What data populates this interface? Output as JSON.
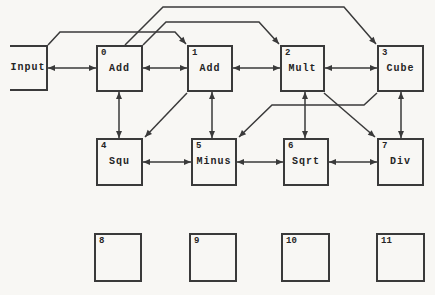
{
  "diagram": {
    "background_color": "#f8f7f4",
    "line_color": "#3a3a3a",
    "text_color": "#252525",
    "nodes": [
      {
        "id": "input",
        "number": "",
        "label": "Input",
        "x": 10,
        "y": 45,
        "w": 38,
        "h": 46,
        "open_left": true
      },
      {
        "id": "0",
        "number": "0",
        "label": "Add",
        "x": 96,
        "y": 45,
        "w": 47,
        "h": 47
      },
      {
        "id": "1",
        "number": "1",
        "label": "Add",
        "x": 187,
        "y": 45,
        "w": 46,
        "h": 47
      },
      {
        "id": "2",
        "number": "2",
        "label": "Mult",
        "x": 280,
        "y": 45,
        "w": 45,
        "h": 47
      },
      {
        "id": "3",
        "number": "3",
        "label": "Cube",
        "x": 377,
        "y": 45,
        "w": 47,
        "h": 47
      },
      {
        "id": "4",
        "number": "4",
        "label": "Squ",
        "x": 96,
        "y": 138,
        "w": 47,
        "h": 48
      },
      {
        "id": "5",
        "number": "5",
        "label": "Minus",
        "x": 191,
        "y": 138,
        "w": 46,
        "h": 48
      },
      {
        "id": "6",
        "number": "6",
        "label": "Sqrt",
        "x": 283,
        "y": 138,
        "w": 46,
        "h": 48
      },
      {
        "id": "7",
        "number": "7",
        "label": "Div",
        "x": 377,
        "y": 138,
        "w": 47,
        "h": 48
      },
      {
        "id": "8",
        "number": "8",
        "label": "",
        "x": 94,
        "y": 233,
        "w": 48,
        "h": 49
      },
      {
        "id": "9",
        "number": "9",
        "label": "",
        "x": 189,
        "y": 233,
        "w": 48,
        "h": 49
      },
      {
        "id": "10",
        "number": "10",
        "label": "",
        "x": 281,
        "y": 233,
        "w": 49,
        "h": 49
      },
      {
        "id": "11",
        "number": "11",
        "label": "",
        "x": 376,
        "y": 233,
        "w": 49,
        "h": 49
      }
    ],
    "edges": [
      {
        "name": "input-add0",
        "from": "input",
        "to": "0",
        "points": [
          [
            48,
            68
          ],
          [
            96,
            68
          ]
        ],
        "arrow_start": true,
        "arrow_end": true
      },
      {
        "name": "add0-add1",
        "from": "0",
        "to": "1",
        "points": [
          [
            143,
            68
          ],
          [
            187,
            68
          ]
        ],
        "arrow_start": true,
        "arrow_end": true
      },
      {
        "name": "add1-mult2",
        "from": "1",
        "to": "2",
        "points": [
          [
            233,
            68
          ],
          [
            280,
            68
          ]
        ],
        "arrow_start": true,
        "arrow_end": true
      },
      {
        "name": "mult2-cube3",
        "from": "2",
        "to": "3",
        "points": [
          [
            325,
            68
          ],
          [
            377,
            68
          ]
        ],
        "arrow_start": true,
        "arrow_end": true
      },
      {
        "name": "squ4-minus5",
        "from": "4",
        "to": "5",
        "points": [
          [
            143,
            162
          ],
          [
            191,
            162
          ]
        ],
        "arrow_start": true,
        "arrow_end": true
      },
      {
        "name": "minus5-sqrt6",
        "from": "5",
        "to": "6",
        "points": [
          [
            237,
            162
          ],
          [
            283,
            162
          ]
        ],
        "arrow_start": true,
        "arrow_end": true
      },
      {
        "name": "sqrt6-div7",
        "from": "6",
        "to": "7",
        "points": [
          [
            329,
            162
          ],
          [
            377,
            162
          ]
        ],
        "arrow_start": true,
        "arrow_end": true
      },
      {
        "name": "add0-squ4",
        "from": "0",
        "to": "4",
        "points": [
          [
            119,
            92
          ],
          [
            119,
            138
          ]
        ],
        "arrow_start": true,
        "arrow_end": true
      },
      {
        "name": "add1-minus5",
        "from": "1",
        "to": "5",
        "points": [
          [
            212,
            92
          ],
          [
            212,
            138
          ]
        ],
        "arrow_start": true,
        "arrow_end": true
      },
      {
        "name": "mult2-sqrt6",
        "from": "2",
        "to": "6",
        "points": [
          [
            305,
            92
          ],
          [
            305,
            138
          ]
        ],
        "arrow_start": true,
        "arrow_end": true
      },
      {
        "name": "cube3-div7",
        "from": "3",
        "to": "7",
        "points": [
          [
            401,
            92
          ],
          [
            401,
            138
          ]
        ],
        "arrow_start": true,
        "arrow_end": true
      },
      {
        "name": "add1-squ4",
        "from": "1",
        "to": "4",
        "points": [
          [
            187,
            93
          ],
          [
            145,
            137
          ]
        ],
        "arrow_start": false,
        "arrow_end": true
      },
      {
        "name": "mult2-div7",
        "from": "2",
        "to": "7",
        "points": [
          [
            324,
            93
          ],
          [
            375,
            137
          ]
        ],
        "arrow_start": false,
        "arrow_end": true
      },
      {
        "name": "cube3-minus5",
        "from": "3",
        "to": "5",
        "points": [
          [
            377,
            93
          ],
          [
            364,
            105
          ],
          [
            272,
            105
          ],
          [
            239,
            137
          ]
        ],
        "arrow_start": false,
        "arrow_end": true
      },
      {
        "name": "input-add1",
        "from": "input",
        "to": "1",
        "points": [
          [
            48,
            45
          ],
          [
            60,
            32
          ],
          [
            175,
            32
          ],
          [
            186,
            44
          ]
        ],
        "arrow_start": false,
        "arrow_end": true
      },
      {
        "name": "add0-mult2",
        "from": "0",
        "to": "2",
        "points": [
          [
            143,
            45
          ],
          [
            166,
            22
          ],
          [
            259,
            22
          ],
          [
            279,
            44
          ]
        ],
        "arrow_start": false,
        "arrow_end": true
      },
      {
        "name": "add0-cube3",
        "from": "0",
        "to": "3",
        "points": [
          [
            125,
            45
          ],
          [
            163,
            7
          ],
          [
            344,
            7
          ],
          [
            376,
            44
          ]
        ],
        "arrow_start": false,
        "arrow_end": true
      }
    ]
  }
}
